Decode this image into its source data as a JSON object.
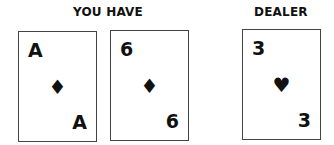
{
  "player": {
    "label": "YOU HAVE",
    "cards": [
      {
        "rank": "A",
        "suit": "diamond",
        "suit_glyph": "♦"
      },
      {
        "rank": "6",
        "suit": "diamond",
        "suit_glyph": "♦"
      }
    ]
  },
  "dealer": {
    "label": "DEALER",
    "cards": [
      {
        "rank": "3",
        "suit": "heart",
        "suit_glyph": "♥"
      }
    ]
  }
}
